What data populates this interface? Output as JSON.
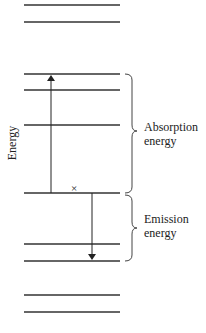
{
  "diagram": {
    "axis_label": "Energy",
    "levels_y": [
      5,
      22,
      74,
      90,
      125,
      193,
      244,
      261,
      295,
      312
    ],
    "level_x_start": 24,
    "level_x_end": 120,
    "ground_level_index": 5,
    "absorption": {
      "label_line1": "Absorption",
      "label_line2": "energy",
      "arrow_x": 51,
      "from_y": 193,
      "to_y": 74
    },
    "emission": {
      "label_line1": "Emission",
      "label_line2": "energy",
      "arrow_x": 92,
      "from_y": 193,
      "to_y": 261
    },
    "marker": {
      "symbol": "×",
      "x": 74,
      "y": 190
    },
    "colors": {
      "line": "#333333",
      "text": "#222222"
    }
  }
}
